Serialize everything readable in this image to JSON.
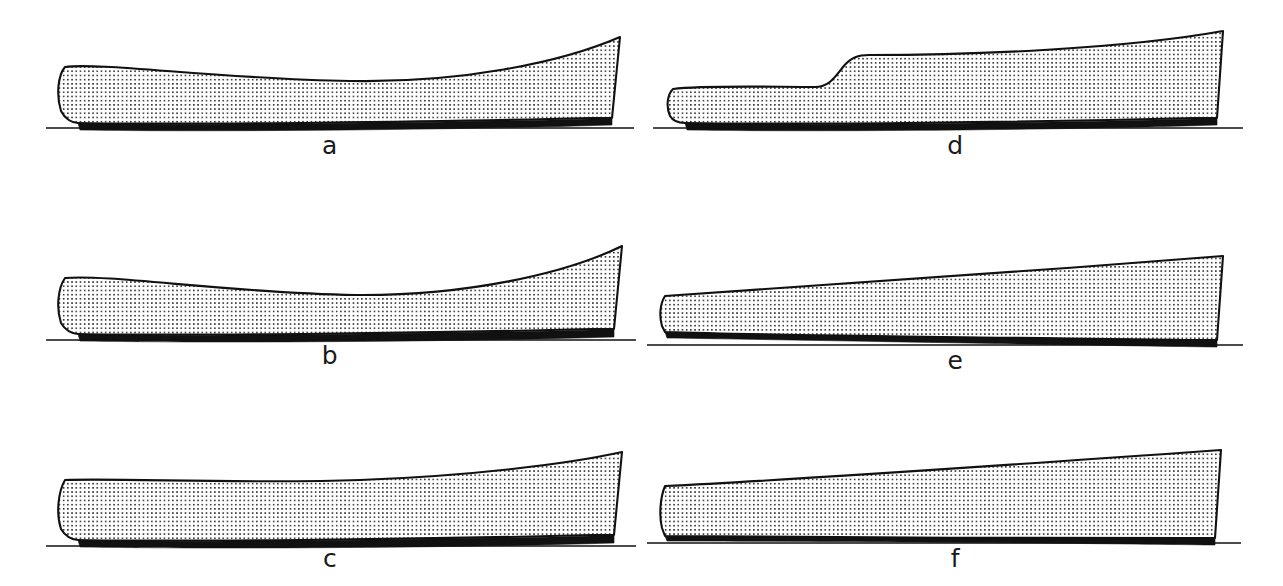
{
  "figure": {
    "background_color": "#ffffff",
    "ink_color": "#111111",
    "stipple_color": "#1a1a1a",
    "stipple_background": "#ffffff",
    "panel_count": 6
  },
  "panels": [
    {
      "id": "a",
      "label": "a",
      "description": "Displacement hull with pronounced concave sheer, rounded forefoot and raked transom",
      "x": 20,
      "y": 15,
      "width": 620,
      "height": 160,
      "label_x": 0,
      "label_y": 118,
      "geometry": {
        "deck": "M 45,52 C 80,47 200,64 330,66 C 440,68 540,48 600,22",
        "stem": "M 45,52 C 38,60 36,80 41,96 C 45,104 52,108 58,108",
        "keel": "M 58,108 C 170,110 420,107 570,103 L 592,103",
        "transom": "M 600,22 L 592,103",
        "boottop": "M 58,108 C 170,111 420,108 570,104 L 592,104 L 592,110 C 430,115 180,117 60,115 Z",
        "waterline_y": 113,
        "waterline_x1": 26,
        "waterline_x2": 614
      }
    },
    {
      "id": "b",
      "label": "b",
      "description": "Similar displacement hull, slightly deeper concave sheer and finer bow",
      "x": 20,
      "y": 230,
      "width": 620,
      "height": 155,
      "label_x": 0,
      "label_y": 113,
      "geometry": {
        "deck": "M 45,48 C 90,44 210,63 335,65 C 445,66 545,44 602,16",
        "stem": "M 45,48 C 38,58 36,78 41,93 C 45,100 52,104 58,104",
        "keel": "M 58,104 C 170,106 420,103 572,99 L 594,99",
        "transom": "M 602,16 L 594,99",
        "boottop": "M 58,104 C 170,107 420,104 572,100 L 594,100 L 594,107 C 430,112 180,113 60,111 Z",
        "waterline_y": 110,
        "waterline_x1": 26,
        "waterline_x2": 616
      }
    },
    {
      "id": "c",
      "label": "c",
      "description": "Hull with nearly straight sheer from bow, rising steadily aft to a high raked transom",
      "x": 20,
      "y": 440,
      "width": 620,
      "height": 148,
      "label_x": 0,
      "label_y": 106,
      "geometry": {
        "deck": "M 45,40 C 100,38 230,44 340,40 C 450,36 548,24 602,12",
        "stem": "M 45,40 C 38,52 36,74 41,89 C 45,96 52,100 58,100",
        "keel": "M 58,100 C 170,102 420,99 572,95 L 594,95",
        "transom": "M 602,12 L 594,95",
        "boottop": "M 58,100 C 170,103 420,100 572,96 L 594,96 L 594,103 C 430,108 180,109 60,107 Z",
        "waterline_y": 106,
        "waterline_x1": 26,
        "waterline_x2": 616
      }
    },
    {
      "id": "d",
      "label": "d",
      "description": "Stepped hull: low flush forward deck, abrupt rise amidships to a high raised aft deck",
      "x": 643,
      "y": 15,
      "width": 625,
      "height": 160,
      "label_x": 0,
      "label_y": 118,
      "geometry": {
        "deck": "M 30,74 C 60,70 130,72 172,72 C 186,72 192,62 200,52 C 208,42 216,40 226,40 C 330,40 480,34 580,16",
        "stem": "M 30,74 C 24,80 23,92 27,101 C 30,106 36,108 42,108",
        "keel": "M 42,108 C 160,110 400,107 552,103 L 574,103",
        "transom": "M 580,16 L 574,103",
        "boottop": "M 42,108 C 160,111 400,108 552,104 L 574,104 L 574,110 C 420,115 170,117 44,115 Z",
        "waterline_y": 113,
        "waterline_x1": 10,
        "waterline_x2": 600
      }
    },
    {
      "id": "e",
      "label": "e",
      "description": "Simple wedge hull: very low blunt bow rising in a straight line to a deep transom",
      "x": 643,
      "y": 240,
      "width": 625,
      "height": 150,
      "label_x": 0,
      "label_y": 108,
      "geometry": {
        "deck": "M 22,56 C 140,48 380,32 580,16",
        "stem": "M 22,56 C 17,64 16,76 19,86 L 22,92",
        "keel": "M 22,92 C 150,96 400,98 552,100 L 574,100",
        "transom": "M 580,16 L 574,100",
        "boottop": "M 22,92 C 150,96 400,98 552,100 L 574,100 L 574,107 C 420,105 160,100 24,98 Z",
        "waterline_y": 105,
        "waterline_x1": 4,
        "waterline_x2": 600
      }
    },
    {
      "id": "f",
      "label": "f",
      "description": "Straight-sheered wedge hull with flat keel, deck rising evenly to a tall vertical transom",
      "x": 643,
      "y": 440,
      "width": 625,
      "height": 148,
      "label_x": 0,
      "label_y": 106,
      "geometry": {
        "deck": "M 22,46 C 150,40 380,24 578,10",
        "stem": "M 22,46 C 17,58 16,76 19,88 L 22,96",
        "keel": "M 22,96 C 150,98 400,98 550,98 L 572,98",
        "transom": "M 578,10 L 572,98",
        "boottop": "M 22,96 C 150,98 400,98 550,98 L 572,98 L 572,105 C 420,103 160,101 24,101 Z",
        "waterline_y": 103,
        "waterline_x1": 4,
        "waterline_x2": 598
      }
    }
  ]
}
